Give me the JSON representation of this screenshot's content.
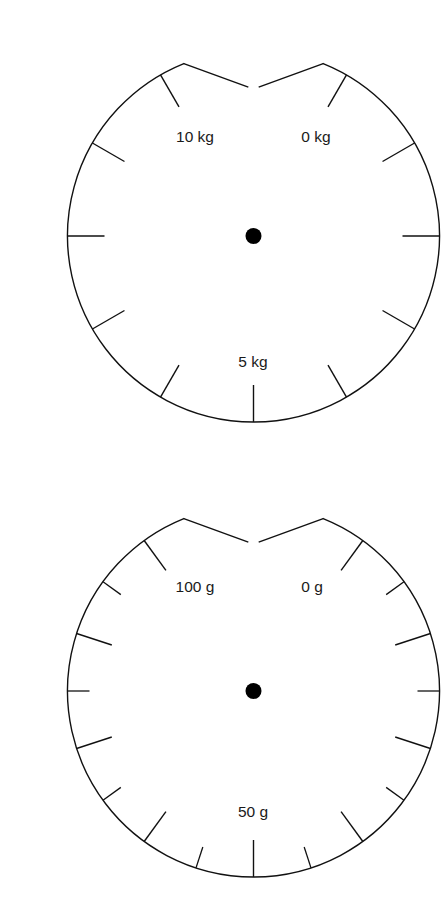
{
  "page": {
    "background_color": "#ffffff",
    "width": 427,
    "height": 901,
    "stroke_color": "#111111",
    "label_color": "#1a1a1a",
    "hub_color": "#000000"
  },
  "chart_data": [
    {
      "id": "kilogram-dial",
      "type": "gauge",
      "title": "",
      "unit": "kg",
      "scale_min": 0,
      "scale_max": 10,
      "divisions": 12,
      "division_step_deg": 30,
      "gap_top_half_angle_deg": 22,
      "tick_style": "uniform",
      "tick_length_px": 37,
      "center": {
        "x": 213.5,
        "y": 220
      },
      "radius_px": 186,
      "hub_radius_px": 8,
      "labels": [
        {
          "text": "0 kg",
          "value": 0,
          "angle_deg": 22,
          "x": 276,
          "y": 122
        },
        {
          "text": "5 kg",
          "value": 5,
          "angle_deg": 180,
          "x": 213,
          "y": 347
        },
        {
          "text": "10 kg",
          "value": 10,
          "angle_deg": 338,
          "x": 155,
          "y": 122
        }
      ],
      "tick_angles_deg": [
        22,
        30,
        60,
        90,
        120,
        150,
        180,
        210,
        240,
        270,
        300,
        330,
        338
      ]
    },
    {
      "id": "gram-dial",
      "type": "gauge",
      "title": "",
      "unit": "g",
      "scale_min": 0,
      "scale_max": 100,
      "divisions": 20,
      "division_step_deg": 18,
      "gap_top_half_angle_deg": 22,
      "tick_style": "alternating-major-minor",
      "tick_length_major_px": 37,
      "tick_length_minor_px": 22,
      "center": {
        "x": 213.5,
        "y": 675
      },
      "radius_px": 186,
      "hub_radius_px": 8,
      "labels": [
        {
          "text": "0 g",
          "value": 0,
          "angle_deg": 22,
          "x": 272,
          "y": 572
        },
        {
          "text": "50 g",
          "value": 50,
          "angle_deg": 180,
          "x": 213,
          "y": 797
        },
        {
          "text": "100 g",
          "value": 100,
          "angle_deg": 338,
          "x": 155,
          "y": 572
        }
      ],
      "tick_angles_deg": [
        22,
        36,
        54,
        72,
        90,
        108,
        126,
        144,
        162,
        180,
        198,
        216,
        234,
        252,
        270,
        288,
        306,
        324,
        338
      ]
    }
  ]
}
